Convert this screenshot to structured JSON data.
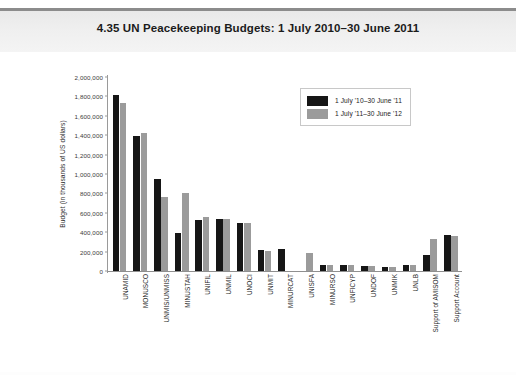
{
  "header": {
    "title": "4.35  UN Peacekeeping Budgets: 1 July 2010–30 June 2011"
  },
  "chart_data": {
    "type": "bar",
    "title": "4.35  UN Peacekeeping Budgets: 1 July 2010–30 June 2011",
    "xlabel": "",
    "ylabel": "Budget (in thousands of US dollars)",
    "ylim": [
      0,
      2000000
    ],
    "grid": false,
    "legend_position": "top-right",
    "ytick_labels": [
      "0",
      "200,000",
      "400,000",
      "600,000",
      "800,000",
      "1,000,000",
      "1,200,000",
      "1,400,000",
      "1,600,000",
      "1,800,000",
      "2,000,000"
    ],
    "ytick_values": [
      0,
      200000,
      400000,
      600000,
      800000,
      1000000,
      1200000,
      1400000,
      1600000,
      1800000,
      2000000
    ],
    "categories": [
      "UNAMID",
      "MONUSCO",
      "UNMIS/UNMISS",
      "MINUSTAH",
      "UNIFIL",
      "UNMIL",
      "UNOCI",
      "UNMIT",
      "MINURCAT",
      "UNISFA",
      "MINURSO",
      "UNFICYP",
      "UNDOF",
      "UNMIK",
      "UNLB",
      "Support of AMISOM",
      "Support Account"
    ],
    "series": [
      {
        "name": "1 July '10–30 June '11",
        "color": "#161616",
        "values": [
          1810000,
          1390000,
          950000,
          390000,
          530000,
          540000,
          490000,
          220000,
          230000,
          0,
          60000,
          57000,
          48000,
          45000,
          60000,
          170000,
          370000
        ]
      },
      {
        "name": "1 July '11–30 June '12",
        "color": "#9b9b9b",
        "values": [
          1730000,
          1420000,
          760000,
          800000,
          560000,
          540000,
          500000,
          210000,
          0,
          190000,
          63000,
          58000,
          50000,
          46000,
          62000,
          330000,
          360000
        ]
      }
    ]
  },
  "legend": {
    "items": [
      {
        "label": "1 July '10–30 June '11",
        "color": "#161616"
      },
      {
        "label": "1 July '11–30 June '12",
        "color": "#9b9b9b"
      }
    ]
  }
}
